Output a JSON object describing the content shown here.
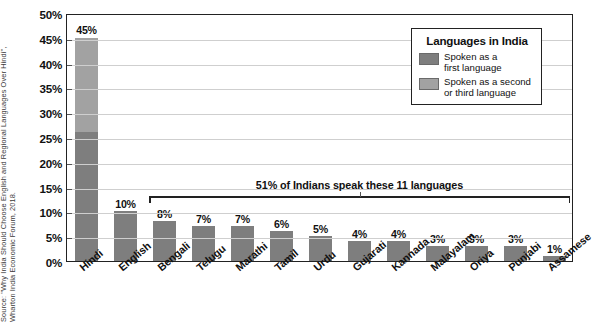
{
  "source_note": "Source: \"Why India Should Choose English and Regional Languages Over Hindi\",\nWharton India Economic Forum, 2018.",
  "legend": {
    "title": "Languages in India",
    "items": [
      {
        "label": "Spoken as a\nfirst language",
        "color": "#7e7e7e",
        "key": "first"
      },
      {
        "label": "Spoken as a second\nor third language",
        "color": "#a2a2a2",
        "key": "second"
      }
    ]
  },
  "annotation": {
    "text": "51% of Indians speak these 11 languages",
    "spans_from": "Bengali",
    "spans_to": "Assamese"
  },
  "chart_data": {
    "type": "bar",
    "title": "",
    "xlabel": "",
    "ylabel": "",
    "ylim": [
      0,
      50
    ],
    "ytick_step": 5,
    "ytick_labels": [
      "0%",
      "5%",
      "10%",
      "15%",
      "20%",
      "25%",
      "30%",
      "35%",
      "40%",
      "45%",
      "50%"
    ],
    "grid": true,
    "legend_position": "top-right",
    "stacked": true,
    "categories": [
      "Hindi",
      "English",
      "Bengali",
      "Telugu",
      "Marathi",
      "Tamil",
      "Urdu",
      "Gujarati",
      "Kannada",
      "Malayalam",
      "Oriya",
      "Punjabi",
      "Assamese"
    ],
    "values": [
      45,
      10,
      8,
      7,
      7,
      6,
      5,
      4,
      4,
      3,
      3,
      3,
      1
    ],
    "data_labels": [
      "45%",
      "10%",
      "8%",
      "7%",
      "7%",
      "6%",
      "5%",
      "4%",
      "4%",
      "3%",
      "3%",
      "3%",
      "1%"
    ],
    "series": [
      {
        "name": "Spoken as a first language",
        "color": "#7e7e7e",
        "values": [
          26,
          10,
          8,
          7,
          7,
          6,
          5,
          4,
          4,
          3,
          3,
          3,
          1
        ]
      },
      {
        "name": "Spoken as a second or third language",
        "color": "#a2a2a2",
        "values": [
          19,
          0,
          0,
          0,
          0,
          0,
          0,
          0,
          0,
          0,
          0,
          0,
          0
        ]
      }
    ]
  }
}
